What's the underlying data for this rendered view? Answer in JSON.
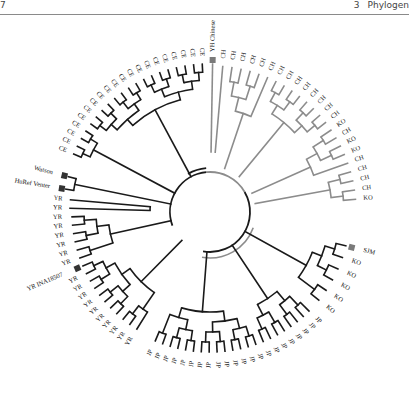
{
  "header": {
    "page_number": "7",
    "chapter_number": "3",
    "chapter_title": "Phylogen"
  },
  "figure": {
    "type": "circular phylogenetic tree",
    "colors": {
      "dark_branch": "#1a1a1a",
      "gray_branch": "#8c8c8c",
      "marker": "#333333",
      "gray_marker": "#7a7a7a"
    },
    "center": [
      210,
      212
    ],
    "marked_individuals": [
      {
        "label": "YH Chinese",
        "angle": -90
      },
      {
        "label": "Watson",
        "angle": 196
      },
      {
        "label": "HuRef Venter",
        "angle": 192
      },
      {
        "label": "YR INA18507",
        "angle": 150
      },
      {
        "label": "SJM",
        "angle": 16
      }
    ],
    "groups": [
      {
        "name": "CE",
        "color": "gray",
        "count": 20,
        "start_angle": -92,
        "end_angle": -160
      },
      {
        "name": "CH",
        "color": "gray",
        "count": 16,
        "start_angle": -86,
        "end_angle": -28
      },
      {
        "name": "KO/CH mix",
        "color": "gray",
        "labels": [
          "KO",
          "CH",
          "KO",
          "KO",
          "CH",
          "CH",
          "CH",
          "CH",
          "KO"
        ]
      },
      {
        "name": "KO",
        "color": "dark",
        "labels": [
          "KO",
          "KO",
          "KO",
          "KO",
          "KO"
        ]
      },
      {
        "name": "JP",
        "color": "dark",
        "count": 22
      },
      {
        "name": "YR",
        "color": "dark",
        "count": 19
      }
    ],
    "leaves_right": [
      "CH",
      "CH",
      "CH",
      "CH",
      "CH",
      "CH",
      "CH",
      "CH",
      "CH",
      "CH",
      "CH",
      "CH",
      "CH",
      "CH",
      "KO",
      "CH",
      "KO",
      "KO",
      "CH",
      "CH",
      "CH",
      "CH",
      "KO"
    ],
    "leaves_right_lower": [
      "KO",
      "KO",
      "KO",
      "KO",
      "KO"
    ],
    "leaves_ce": [
      "CE",
      "CE",
      "CE",
      "CE",
      "CE",
      "CE",
      "CE",
      "CE",
      "CE",
      "CE",
      "CE",
      "CE",
      "CE",
      "CE",
      "CE",
      "CE",
      "CE",
      "CE",
      "CE",
      "CE"
    ],
    "leaves_yr": [
      "YR",
      "YR",
      "YR",
      "YR",
      "YR",
      "YR",
      "YR",
      "YR",
      "YR",
      "YR",
      "YR",
      "YR",
      "YR",
      "YR",
      "YR",
      "YR",
      "YR",
      "YR",
      "YR"
    ],
    "leaves_jp": [
      "JP",
      "JP",
      "JP",
      "JP",
      "JP",
      "JP",
      "JP",
      "JP",
      "JP",
      "JP",
      "JP",
      "JP",
      "JP",
      "JP",
      "JP",
      "JP",
      "JP",
      "JP",
      "JP",
      "JP",
      "JP",
      "JP"
    ]
  }
}
